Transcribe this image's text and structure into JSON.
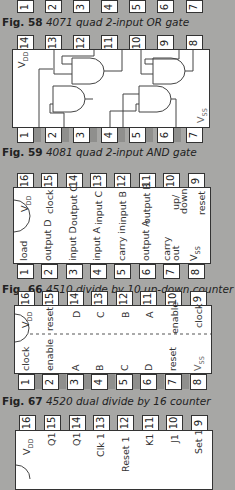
{
  "colors": {
    "background": "#a7a7a5",
    "chip": "#ffffff",
    "outline": "#333333"
  },
  "fig58": {
    "bottom_pins": [
      "1",
      "2",
      "3",
      "4",
      "5",
      "6",
      "7"
    ],
    "caption_num": "Fig. 58",
    "caption_text": "4071 quad 2-input OR gate"
  },
  "fig59": {
    "top_pins": [
      "14",
      "13",
      "12",
      "11",
      "10",
      "9",
      "8"
    ],
    "bottom_pins": [
      "1",
      "2",
      "3",
      "4",
      "5",
      "6",
      "7"
    ],
    "vdd": "V",
    "vdd_sub": "DD",
    "vss": "V",
    "vss_sub": "SS",
    "caption_num": "Fig. 59",
    "caption_text": "4081 quad 2-input AND gate"
  },
  "fig66": {
    "top_pins": [
      "16",
      "15",
      "14",
      "13",
      "12",
      "11",
      "10",
      "9"
    ],
    "bottom_pins": [
      "1",
      "2",
      "3",
      "4",
      "5",
      "6",
      "7",
      "8"
    ],
    "top_labels": [
      "V",
      "clock",
      "output C",
      "input C",
      "input B",
      "output B",
      "up/\ndown",
      "reset"
    ],
    "bottom_labels": [
      "load",
      "output D",
      "input D",
      "input A",
      "carry in",
      "output A",
      "carry\nout",
      "V"
    ],
    "vdd_sub": "DD",
    "vss_sub": "SS",
    "caption_num": "Fig. 66",
    "caption_text": "4510 divide by 10 up-down counter"
  },
  "fig67": {
    "top_pins": [
      "16",
      "15",
      "14",
      "13",
      "12",
      "11",
      "10",
      "9"
    ],
    "bottom_pins": [
      "1",
      "2",
      "3",
      "4",
      "5",
      "6",
      "7",
      "8"
    ],
    "top_labels": [
      "V",
      "reset",
      "D",
      "C",
      "B",
      "A",
      "enable",
      "clock"
    ],
    "bottom_labels": [
      "clock",
      "enable",
      "A",
      "B",
      "C",
      "D",
      "reset",
      "V"
    ],
    "vdd_sub": "DD",
    "vss_sub": "SS",
    "caption_num": "Fig. 67",
    "caption_text": "4520 dual divide by 16 counter"
  },
  "next_chip": {
    "top_pins": [
      "16",
      "15",
      "14",
      "13",
      "12",
      "11",
      "10",
      "9"
    ],
    "top_labels": [
      "V",
      "Q1",
      "Q1",
      "Clk 1",
      "Reset 1",
      "K1",
      "J1",
      "Set 1"
    ],
    "vdd_sub": "DD"
  }
}
